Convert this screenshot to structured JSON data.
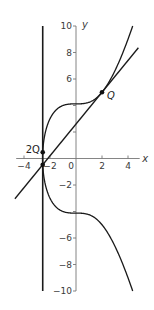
{
  "chart_data": {
    "type": "line",
    "title": "",
    "xlabel": "x",
    "ylabel": "y",
    "xlim": [
      -4.5,
      5
    ],
    "ylim": [
      -10,
      10
    ],
    "grid": false,
    "legend": null,
    "x_ticks": [
      -4,
      -2,
      0,
      2,
      4
    ],
    "x_tick_labels": [
      "−4",
      "−2",
      "0",
      "2",
      "4"
    ],
    "y_ticks": [
      -10,
      -8,
      -6,
      -4,
      -2,
      2,
      4,
      6,
      8,
      10
    ],
    "y_tick_labels": [
      "−10",
      "−8",
      "−6",
      "",
      "−2",
      "",
      "",
      "6",
      "8",
      "10"
    ],
    "series": [
      {
        "name": "elliptic curve",
        "equation": "y^2 = x^3 + 17",
        "x_range": [
          -2.5713,
          4.36
        ],
        "color": "#1a1a1a"
      },
      {
        "name": "tangent line at Q",
        "equation": "y = 1.2x + 2.6",
        "x_range": [
          -4.7,
          4.8
        ],
        "color": "#1a1a1a"
      },
      {
        "name": "vertical line",
        "equation": "x = -2.56",
        "y_range": [
          -10,
          10
        ],
        "color": "#1a1a1a"
      }
    ],
    "points": [
      {
        "label": "Q",
        "x": 2,
        "y": 5,
        "italic": true
      },
      {
        "label": "2Q",
        "x": -2.56,
        "y": 0.47,
        "italic": false
      },
      {
        "label": "",
        "x": -2.56,
        "y": -0.47,
        "italic": false
      }
    ]
  },
  "labels": {
    "x_axis": "x",
    "y_axis": "y",
    "point_q": "Q",
    "point_2q": "2Q"
  }
}
